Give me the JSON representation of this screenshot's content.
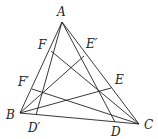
{
  "diagram": {
    "type": "triangle-cevians",
    "points": {
      "A": {
        "x": 62,
        "y": 22,
        "label": "A",
        "lx": 57,
        "ly": 16
      },
      "B": {
        "x": 20,
        "y": 113,
        "label": "B",
        "lx": 6,
        "ly": 119
      },
      "C": {
        "x": 139,
        "y": 124,
        "label": "C",
        "lx": 144,
        "ly": 129
      },
      "F": {
        "x": 51,
        "y": 51,
        "label": "F",
        "lx": 38,
        "ly": 49
      },
      "F'": {
        "x": 32,
        "y": 89,
        "label": "F′",
        "lx": 18,
        "ly": 86
      },
      "E'": {
        "x": 84,
        "y": 56,
        "label": "E′",
        "lx": 86,
        "ly": 48
      },
      "E": {
        "x": 111,
        "y": 88,
        "label": "E",
        "lx": 115,
        "ly": 84
      },
      "D'": {
        "x": 36,
        "y": 115,
        "label": "D′",
        "lx": 28,
        "ly": 132
      },
      "D": {
        "x": 115,
        "y": 122,
        "label": "D",
        "lx": 111,
        "ly": 136
      }
    },
    "segments": [
      [
        "A",
        "B"
      ],
      [
        "A",
        "C"
      ],
      [
        "B",
        "C"
      ],
      [
        "A",
        "D"
      ],
      [
        "A",
        "D'"
      ],
      [
        "B",
        "E"
      ],
      [
        "B",
        "E'"
      ],
      [
        "C",
        "F"
      ],
      [
        "C",
        "F'"
      ]
    ]
  }
}
